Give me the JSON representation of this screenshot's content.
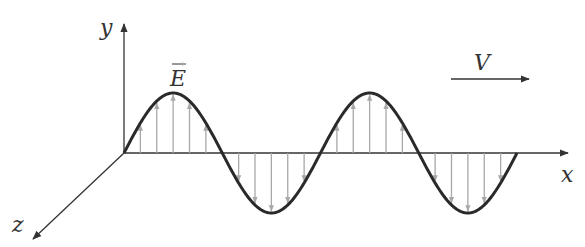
{
  "diagram": {
    "axes": {
      "x_label": "x",
      "y_label": "y",
      "z_label": "z"
    },
    "field_label": "E",
    "velocity_label": "V",
    "colors": {
      "axis": "#333333",
      "wave": "#2a2a2a",
      "field_vectors": "#a8a8a8",
      "background": "#ffffff"
    },
    "wave": {
      "cycles": 2,
      "origin_px": [
        124,
        153
      ],
      "half_period_px": 98.25,
      "amplitude_px": 60
    }
  }
}
